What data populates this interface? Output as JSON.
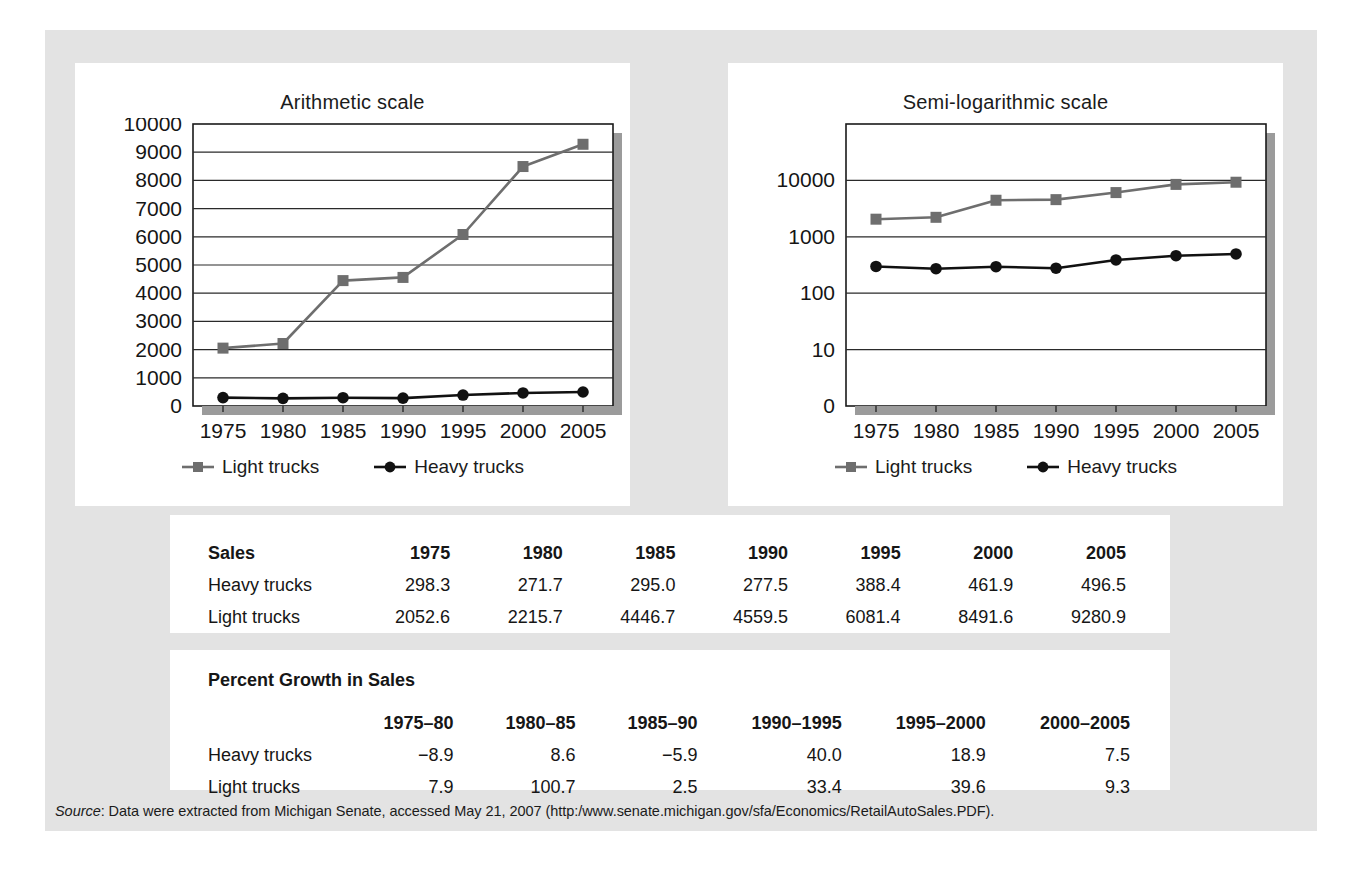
{
  "figure": {
    "charts": [
      {
        "id": "arithmetic",
        "title": "Arithmetic scale",
        "scale": "linear"
      },
      {
        "id": "semilog",
        "title": "Semi-logarithmic scale",
        "scale": "log"
      }
    ],
    "legend": {
      "light_label": "Light trucks",
      "heavy_label": "Heavy trucks",
      "light_color": "#6e6e6e",
      "heavy_color": "#111111"
    },
    "sales_table": {
      "corner_label": "Sales",
      "columns": [
        "1975",
        "1980",
        "1985",
        "1990",
        "1995",
        "2000",
        "2005"
      ],
      "rows": [
        {
          "label": "Heavy trucks",
          "values": [
            "298.3",
            "271.7",
            "295.0",
            "277.5",
            "388.4",
            "461.9",
            "496.5"
          ]
        },
        {
          "label": "Light trucks",
          "values": [
            "2052.6",
            "2215.7",
            "4446.7",
            "4559.5",
            "6081.4",
            "8491.6",
            "9280.9"
          ]
        }
      ]
    },
    "growth_table": {
      "caption": "Percent Growth in Sales",
      "corner_label": "",
      "columns": [
        "1975–80",
        "1980–85",
        "1985–90",
        "1990–1995",
        "1995–2000",
        "2000–2005"
      ],
      "rows": [
        {
          "label": "Heavy trucks",
          "values": [
            "−8.9",
            "8.6",
            "−5.9",
            "40.0",
            "18.9",
            "7.5"
          ]
        },
        {
          "label": "Light trucks",
          "values": [
            "7.9",
            "100.7",
            "2.5",
            "33.4",
            "39.6",
            "9.3"
          ]
        }
      ]
    },
    "source": {
      "label": "Source",
      "text": ": Data were extracted from Michigan Senate, accessed May 21, 2007 (http:/www.senate.michigan.gov/sfa/Economics/RetailAutoSales.PDF)."
    }
  },
  "chart_data": [
    {
      "type": "line",
      "id": "arithmetic",
      "title": "Arithmetic scale",
      "xlabel": "",
      "ylabel": "",
      "x": [
        1975,
        1980,
        1985,
        1990,
        1995,
        2000,
        2005
      ],
      "xticks": [
        "1975",
        "1980",
        "1985",
        "1990",
        "1995",
        "2000",
        "2005"
      ],
      "yticks": [
        "0",
        "1000",
        "2000",
        "3000",
        "4000",
        "5000",
        "6000",
        "7000",
        "8000",
        "9000",
        "10000"
      ],
      "ylim": [
        0,
        10000
      ],
      "yscale": "linear",
      "grid": "horizontal",
      "legend_position": "bottom",
      "series": [
        {
          "name": "Light trucks",
          "color": "#6e6e6e",
          "marker": "square",
          "values": [
            2052.6,
            2215.7,
            4446.7,
            4559.5,
            6081.4,
            8491.6,
            9280.9
          ]
        },
        {
          "name": "Heavy trucks",
          "color": "#111111",
          "marker": "circle",
          "values": [
            298.3,
            271.7,
            295.0,
            277.5,
            388.4,
            461.9,
            496.5
          ]
        }
      ]
    },
    {
      "type": "line",
      "id": "semilog",
      "title": "Semi-logarithmic scale",
      "xlabel": "",
      "ylabel": "",
      "x": [
        1975,
        1980,
        1985,
        1990,
        1995,
        2000,
        2005
      ],
      "xticks": [
        "1975",
        "1980",
        "1985",
        "1990",
        "1995",
        "2000",
        "2005"
      ],
      "yticks": [
        "0",
        "10",
        "100",
        "1000",
        "10000"
      ],
      "ylim": [
        1,
        10000
      ],
      "yscale": "log",
      "grid": "horizontal",
      "legend_position": "bottom",
      "series": [
        {
          "name": "Light trucks",
          "color": "#6e6e6e",
          "marker": "square",
          "values": [
            2052.6,
            2215.7,
            4446.7,
            4559.5,
            6081.4,
            8491.6,
            9280.9
          ]
        },
        {
          "name": "Heavy trucks",
          "color": "#111111",
          "marker": "circle",
          "values": [
            298.3,
            271.7,
            295.0,
            277.5,
            388.4,
            461.9,
            496.5
          ]
        }
      ]
    }
  ]
}
